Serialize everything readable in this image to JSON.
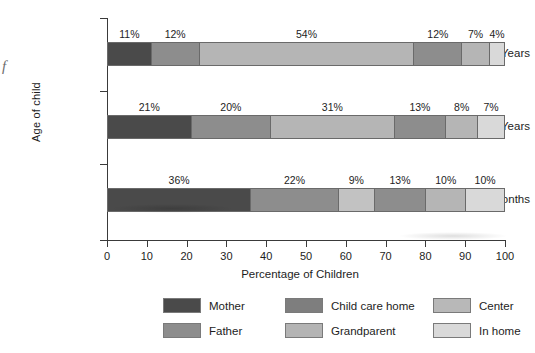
{
  "chart_data": {
    "type": "bar",
    "orientation": "horizontal",
    "stacked": true,
    "stack_total": 100,
    "title": "",
    "xlabel": "Percentage of Children",
    "ylabel": "Age of child",
    "xlim": [
      0,
      100
    ],
    "xticks": [
      0,
      10,
      20,
      30,
      40,
      50,
      60,
      70,
      80,
      90,
      100
    ],
    "xtick_labels": [
      "0",
      "10",
      "20",
      "30",
      "40",
      "50",
      "60",
      "70",
      "80",
      "90",
      "100"
    ],
    "grid": false,
    "legend_position": "bottom",
    "categories": [
      "4½ Years",
      "3 Years",
      "6 Months"
    ],
    "series": [
      {
        "name": "Mother",
        "color": "#4a4a4a",
        "values": [
          11,
          21,
          36
        ]
      },
      {
        "name": "Father",
        "color": "#8d8d8d",
        "values": [
          12,
          20,
          22
        ]
      },
      {
        "name": "Child care home",
        "color": "#b5b5b5",
        "values": [
          54,
          31,
          9
        ]
      },
      {
        "name": "Grandparent",
        "color": "#8d8d8d",
        "values": [
          12,
          13,
          13
        ]
      },
      {
        "name": "Center",
        "color": "#b5b5b5",
        "values": [
          7,
          8,
          10
        ]
      },
      {
        "name": "In home",
        "color": "#d9d9d9",
        "values": [
          4,
          7,
          10
        ]
      }
    ],
    "bars": [
      {
        "category": "4½ Years",
        "segments": [
          {
            "name": "Mother",
            "value": 11,
            "label": "11%",
            "color": "#4a4a4a"
          },
          {
            "name": "Father",
            "value": 12,
            "label": "12%",
            "color": "#8d8d8d"
          },
          {
            "name": "Child care home",
            "value": 54,
            "label": "54%",
            "color": "#b5b5b5"
          },
          {
            "name": "Grandparent",
            "value": 12,
            "label": "12%",
            "color": "#8d8d8d"
          },
          {
            "name": "Center",
            "value": 7,
            "label": "7%",
            "color": "#b5b5b5"
          },
          {
            "name": "In home",
            "value": 4,
            "label": "4%",
            "color": "#d9d9d9"
          }
        ]
      },
      {
        "category": "3 Years",
        "segments": [
          {
            "name": "Mother",
            "value": 21,
            "label": "21%",
            "color": "#4a4a4a"
          },
          {
            "name": "Father",
            "value": 20,
            "label": "20%",
            "color": "#8d8d8d"
          },
          {
            "name": "Child care home",
            "value": 31,
            "label": "31%",
            "color": "#b5b5b5"
          },
          {
            "name": "Grandparent",
            "value": 13,
            "label": "13%",
            "color": "#8d8d8d"
          },
          {
            "name": "Center",
            "value": 8,
            "label": "8%",
            "color": "#b5b5b5"
          },
          {
            "name": "In home",
            "value": 7,
            "label": "7%",
            "color": "#d9d9d9"
          }
        ]
      },
      {
        "category": "6 Months",
        "segments": [
          {
            "name": "Mother",
            "value": 36,
            "label": "36%",
            "color": "#4a4a4a"
          },
          {
            "name": "Father",
            "value": 22,
            "label": "22%",
            "color": "#8d8d8d"
          },
          {
            "name": "Child care home",
            "value": 9,
            "label": "9%",
            "color": "#c2c2c2"
          },
          {
            "name": "Grandparent",
            "value": 13,
            "label": "13%",
            "color": "#8d8d8d"
          },
          {
            "name": "Center",
            "value": 10,
            "label": "10%",
            "color": "#b5b5b5"
          },
          {
            "name": "In home",
            "value": 10,
            "label": "10%",
            "color": "#d9d9d9"
          }
        ]
      }
    ],
    "legend": [
      {
        "label": "Mother",
        "color": "#4a4a4a"
      },
      {
        "label": "Child care home",
        "color": "#7e7e7e"
      },
      {
        "label": "Center",
        "color": "#b8b8b8"
      },
      {
        "label": "Father",
        "color": "#8d8d8d"
      },
      {
        "label": "Grandparent",
        "color": "#b4b4b4"
      },
      {
        "label": "In home",
        "color": "#d9d9d9"
      }
    ]
  },
  "artifact": {
    "edge_glyph": "f"
  }
}
